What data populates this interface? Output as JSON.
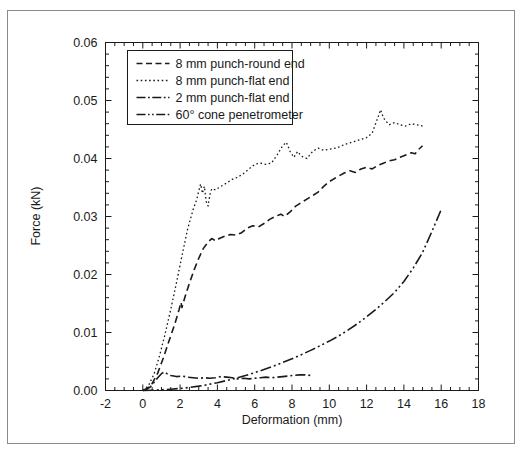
{
  "figure": {
    "background_color": "#ffffff",
    "border_color": "#8a8a8a",
    "line_color": "#1a1a1a"
  },
  "chart_data": {
    "type": "line",
    "title": "",
    "xlabel": "Deformation (mm)",
    "ylabel": "Force (kN)",
    "xlim": [
      -2,
      18
    ],
    "ylim": [
      0.0,
      0.06
    ],
    "xticks": [
      -2,
      0,
      2,
      4,
      6,
      8,
      10,
      12,
      14,
      16,
      18
    ],
    "xtick_labels": [
      "-2",
      "0",
      "2",
      "4",
      "6",
      "8",
      "10",
      "12",
      "14",
      "16",
      "18"
    ],
    "yticks": [
      0.0,
      0.01,
      0.02,
      0.03,
      0.04,
      0.05,
      0.06
    ],
    "ytick_labels": [
      "0.00",
      "0.01",
      "0.02",
      "0.03",
      "0.04",
      "0.05",
      "0.06"
    ],
    "x_minor_tick_step": 0.5,
    "y_minor_tick_step": 0.002,
    "grid": false,
    "legend_position": "upper left",
    "series": [
      {
        "name": "8 mm punch-round end",
        "style": "dashed",
        "dash_pattern": "7,4",
        "color": "#1a1a1a",
        "points": [
          [
            0.0,
            0.0
          ],
          [
            0.25,
            0.0004
          ],
          [
            0.5,
            0.0012
          ],
          [
            0.8,
            0.003
          ],
          [
            1.1,
            0.0056
          ],
          [
            1.4,
            0.0085
          ],
          [
            1.7,
            0.0113
          ],
          [
            1.95,
            0.014
          ],
          [
            2.05,
            0.0152
          ],
          [
            2.1,
            0.0143
          ],
          [
            2.25,
            0.016
          ],
          [
            2.5,
            0.0185
          ],
          [
            2.75,
            0.0208
          ],
          [
            3.0,
            0.0228
          ],
          [
            3.25,
            0.0245
          ],
          [
            3.5,
            0.0256
          ],
          [
            3.7,
            0.0262
          ],
          [
            3.9,
            0.0258
          ],
          [
            4.1,
            0.0262
          ],
          [
            4.4,
            0.0266
          ],
          [
            4.7,
            0.0269
          ],
          [
            5.0,
            0.0268
          ],
          [
            5.3,
            0.0272
          ],
          [
            5.6,
            0.028
          ],
          [
            5.9,
            0.0284
          ],
          [
            6.2,
            0.0282
          ],
          [
            6.5,
            0.0288
          ],
          [
            6.8,
            0.0295
          ],
          [
            7.1,
            0.03
          ],
          [
            7.4,
            0.0304
          ],
          [
            7.6,
            0.03
          ],
          [
            7.9,
            0.0308
          ],
          [
            8.2,
            0.0318
          ],
          [
            8.5,
            0.0324
          ],
          [
            8.8,
            0.033
          ],
          [
            9.1,
            0.0336
          ],
          [
            9.4,
            0.0342
          ],
          [
            9.7,
            0.0352
          ],
          [
            10.0,
            0.036
          ],
          [
            10.4,
            0.0368
          ],
          [
            10.8,
            0.0375
          ],
          [
            11.1,
            0.0379
          ],
          [
            11.4,
            0.0376
          ],
          [
            11.7,
            0.0382
          ],
          [
            12.0,
            0.0385
          ],
          [
            12.3,
            0.0382
          ],
          [
            12.6,
            0.0388
          ],
          [
            12.9,
            0.0392
          ],
          [
            13.2,
            0.0396
          ],
          [
            13.5,
            0.0398
          ],
          [
            13.8,
            0.0402
          ],
          [
            14.1,
            0.0406
          ],
          [
            14.4,
            0.041
          ],
          [
            14.6,
            0.0408
          ],
          [
            14.8,
            0.0416
          ],
          [
            15.0,
            0.0422
          ]
        ]
      },
      {
        "name": "8 mm punch-flat end",
        "style": "dotted",
        "dash_pattern": "1.6,2.6",
        "color": "#1a1a1a",
        "points": [
          [
            0.0,
            0.0
          ],
          [
            0.3,
            0.0008
          ],
          [
            0.6,
            0.0028
          ],
          [
            0.9,
            0.006
          ],
          [
            1.2,
            0.0098
          ],
          [
            1.5,
            0.014
          ],
          [
            1.8,
            0.0185
          ],
          [
            2.1,
            0.0232
          ],
          [
            2.4,
            0.0278
          ],
          [
            2.7,
            0.0312
          ],
          [
            2.9,
            0.033
          ],
          [
            3.0,
            0.0344
          ],
          [
            3.1,
            0.0356
          ],
          [
            3.2,
            0.034
          ],
          [
            3.3,
            0.0352
          ],
          [
            3.4,
            0.0326
          ],
          [
            3.5,
            0.0318
          ],
          [
            3.6,
            0.0338
          ],
          [
            3.7,
            0.0348
          ],
          [
            3.9,
            0.0346
          ],
          [
            4.2,
            0.0352
          ],
          [
            4.5,
            0.0358
          ],
          [
            4.8,
            0.0364
          ],
          [
            5.1,
            0.0368
          ],
          [
            5.4,
            0.0374
          ],
          [
            5.7,
            0.0382
          ],
          [
            6.0,
            0.039
          ],
          [
            6.3,
            0.0392
          ],
          [
            6.6,
            0.039
          ],
          [
            6.9,
            0.0392
          ],
          [
            7.2,
            0.0406
          ],
          [
            7.5,
            0.0422
          ],
          [
            7.7,
            0.0428
          ],
          [
            7.9,
            0.0412
          ],
          [
            8.1,
            0.0402
          ],
          [
            8.3,
            0.0412
          ],
          [
            8.5,
            0.0404
          ],
          [
            8.8,
            0.04
          ],
          [
            9.1,
            0.0412
          ],
          [
            9.4,
            0.0418
          ],
          [
            9.7,
            0.0414
          ],
          [
            10.0,
            0.0416
          ],
          [
            10.4,
            0.0418
          ],
          [
            10.8,
            0.0424
          ],
          [
            11.2,
            0.0428
          ],
          [
            11.6,
            0.0432
          ],
          [
            12.0,
            0.0436
          ],
          [
            12.3,
            0.0444
          ],
          [
            12.6,
            0.047
          ],
          [
            12.75,
            0.0484
          ],
          [
            12.9,
            0.047
          ],
          [
            13.2,
            0.0458
          ],
          [
            13.5,
            0.0462
          ],
          [
            13.8,
            0.0458
          ],
          [
            14.1,
            0.0456
          ],
          [
            14.4,
            0.046
          ],
          [
            14.7,
            0.0458
          ],
          [
            15.0,
            0.0456
          ]
        ]
      },
      {
        "name": "2 mm punch-flat end",
        "style": "dash-dot",
        "dash_pattern": "10,3,2,3",
        "color": "#1a1a1a",
        "points": [
          [
            0.0,
            0.0
          ],
          [
            0.2,
            0.0002
          ],
          [
            0.4,
            0.0006
          ],
          [
            0.6,
            0.0014
          ],
          [
            0.8,
            0.0022
          ],
          [
            1.0,
            0.0029
          ],
          [
            1.15,
            0.0032
          ],
          [
            1.3,
            0.0029
          ],
          [
            1.5,
            0.0026
          ],
          [
            1.8,
            0.0024
          ],
          [
            2.1,
            0.0025
          ],
          [
            2.4,
            0.0023
          ],
          [
            2.7,
            0.0022
          ],
          [
            3.0,
            0.0021
          ],
          [
            3.3,
            0.0022
          ],
          [
            3.6,
            0.0021
          ],
          [
            3.9,
            0.0022
          ],
          [
            4.2,
            0.0024
          ],
          [
            4.5,
            0.0023
          ],
          [
            4.8,
            0.0022
          ],
          [
            5.1,
            0.002
          ],
          [
            5.4,
            0.0021
          ],
          [
            5.7,
            0.002
          ],
          [
            6.0,
            0.0021
          ],
          [
            6.3,
            0.0022
          ],
          [
            6.6,
            0.0023
          ],
          [
            6.9,
            0.0022
          ],
          [
            7.2,
            0.0023
          ],
          [
            7.5,
            0.0024
          ],
          [
            7.8,
            0.0025
          ],
          [
            8.1,
            0.0026
          ],
          [
            8.4,
            0.0027
          ],
          [
            8.7,
            0.0027
          ],
          [
            9.0,
            0.0026
          ]
        ]
      },
      {
        "name": "60° cone penetrometer",
        "style": "dash-dot-dot",
        "dash_pattern": "11,3,2,3,2,3",
        "color": "#1a1a1a",
        "points": [
          [
            0.0,
            0.0
          ],
          [
            0.5,
            5e-05
          ],
          [
            1.0,
            0.00012
          ],
          [
            1.5,
            0.00022
          ],
          [
            2.0,
            0.00035
          ],
          [
            2.5,
            0.00052
          ],
          [
            3.0,
            0.00075
          ],
          [
            3.5,
            0.00102
          ],
          [
            4.0,
            0.00135
          ],
          [
            4.5,
            0.00172
          ],
          [
            5.0,
            0.00212
          ],
          [
            5.5,
            0.00258
          ],
          [
            6.0,
            0.00308
          ],
          [
            6.5,
            0.00362
          ],
          [
            7.0,
            0.0042
          ],
          [
            7.5,
            0.00482
          ],
          [
            8.0,
            0.00548
          ],
          [
            8.5,
            0.00618
          ],
          [
            9.0,
            0.00692
          ],
          [
            9.5,
            0.0077
          ],
          [
            10.0,
            0.00852
          ],
          [
            10.5,
            0.0094
          ],
          [
            11.0,
            0.0104
          ],
          [
            11.5,
            0.0115
          ],
          [
            12.0,
            0.0127
          ],
          [
            12.5,
            0.014
          ],
          [
            13.0,
            0.0154
          ],
          [
            13.5,
            0.0169
          ],
          [
            14.0,
            0.0188
          ],
          [
            14.5,
            0.0211
          ],
          [
            15.0,
            0.0238
          ],
          [
            15.5,
            0.0274
          ],
          [
            16.0,
            0.0312
          ]
        ]
      }
    ],
    "legend_entries": [
      {
        "label": "8 mm punch-round end",
        "style": "dashed"
      },
      {
        "label": "8 mm punch-flat end",
        "style": "dotted"
      },
      {
        "label": "2 mm punch-flat end",
        "style": "dash-dot"
      },
      {
        "label": "60° cone penetrometer",
        "style": "dash-dot-dot"
      }
    ]
  }
}
